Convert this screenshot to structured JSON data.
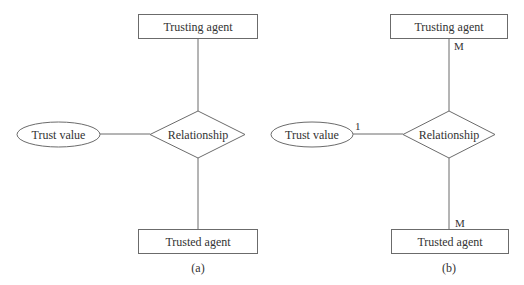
{
  "diagrams": [
    {
      "caption": "(a)",
      "entities": {
        "trusting": "Trusting agent",
        "trusted": "Trusted agent"
      },
      "relationship": "Relationship",
      "attribute": "Trust value",
      "cardinality": {
        "trusting": "",
        "trusted": "",
        "attribute": ""
      }
    },
    {
      "caption": "(b)",
      "entities": {
        "trusting": "Trusting agent",
        "trusted": "Trusted agent"
      },
      "relationship": "Relationship",
      "attribute": "Trust value",
      "cardinality": {
        "trusting": "M",
        "trusted": "M",
        "attribute": "1"
      }
    }
  ],
  "colors": {
    "stroke": "#6b6b6b",
    "text": "#333333",
    "background": "#ffffff"
  }
}
